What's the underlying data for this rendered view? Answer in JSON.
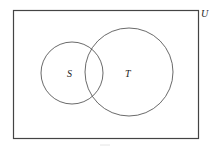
{
  "diagram": {
    "type": "venn",
    "universe": {
      "label": "U"
    },
    "sets": [
      {
        "label": "S"
      },
      {
        "label": "T"
      }
    ]
  }
}
